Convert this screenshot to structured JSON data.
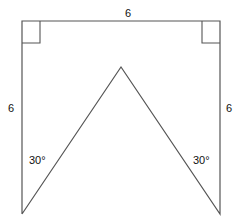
{
  "diagram": {
    "type": "geometry",
    "colors": {
      "stroke": "#555555",
      "text": "#111111",
      "background": "#ffffff"
    },
    "vertices": {
      "top_left": [
        22,
        21
      ],
      "top_right": [
        220,
        21
      ],
      "bottom_right": [
        220,
        214
      ],
      "apex": [
        121,
        67
      ],
      "bottom_left": [
        22,
        214
      ]
    },
    "labels": {
      "top_side": "6",
      "left_side": "6",
      "right_side": "6",
      "left_angle": "30°",
      "right_angle": "30°"
    },
    "right_angle_markers": [
      {
        "corner": "top-left"
      },
      {
        "corner": "top-right"
      }
    ]
  }
}
